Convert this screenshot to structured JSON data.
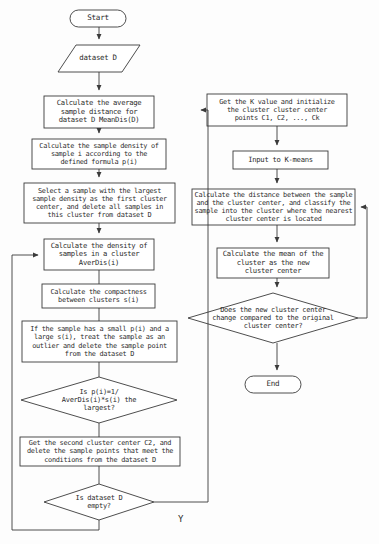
{
  "diagram": {
    "stroke_color": "#3a3a3a",
    "text_color": "#2b2b2b",
    "background": "#fdfdfd"
  },
  "nodes": {
    "start": {
      "label": "Start",
      "shape": "terminator"
    },
    "dataset_input": {
      "label": "dataset D",
      "shape": "parallelogram"
    },
    "avg_distance": {
      "label": "Calculate the average\nsample distance for\ndataset D MeanDis(D)",
      "shape": "process"
    },
    "sample_density": {
      "label": "Calculate the sample density of\nsample i according to the\ndefined formula p(i)",
      "shape": "process"
    },
    "first_center": {
      "label": "Select a sample with the largest\nsample density as the first cluster\ncenter, and delete all samples in\nthis cluster from dataset D",
      "shape": "process"
    },
    "cluster_density": {
      "label": "Calculate the density of\nsamples in a cluster\nAverDis(i)",
      "shape": "process"
    },
    "compactness": {
      "label": "Calculate the compactness\nbetween clusters s(i)",
      "shape": "process"
    },
    "outlier_removal": {
      "label": "If the sample has a small p(i) and a\nlarge s(i), treat the sample as an\noutlier and delete the sample point\nfrom the dataset D",
      "shape": "process"
    },
    "largest_decision": {
      "label": "Is p(i)=1/\nAverDis(i)*s(i) the\nlargest?",
      "shape": "decision"
    },
    "second_center": {
      "label": "Get the second cluster center C2, and\ndelete the sample points that meet the\nconditions from the dataset D",
      "shape": "process"
    },
    "dataset_empty": {
      "label": "Is dataset D\nempty?",
      "shape": "decision"
    },
    "get_k_value": {
      "label": "Get the K value and initialize\nthe cluster cluster center\npoints C1, C2, ..., Ck",
      "shape": "process"
    },
    "input_kmeans": {
      "label": "Input to K-means",
      "shape": "process"
    },
    "assign_clusters": {
      "label": "Calculate the distance between the sample\nand the cluster center, and classify the\nsample into the cluster where the nearest\ncluster center is located",
      "shape": "process"
    },
    "new_center": {
      "label": "Calculate the mean of the\ncluster as the new\ncluster center",
      "shape": "process"
    },
    "center_changed": {
      "label": "Does the new cluster center\nchange compared to the original\ncluster center?",
      "shape": "decision"
    },
    "end": {
      "label": "End",
      "shape": "terminator"
    }
  },
  "edge_labels": {
    "dataset_empty_yes": "Y"
  }
}
